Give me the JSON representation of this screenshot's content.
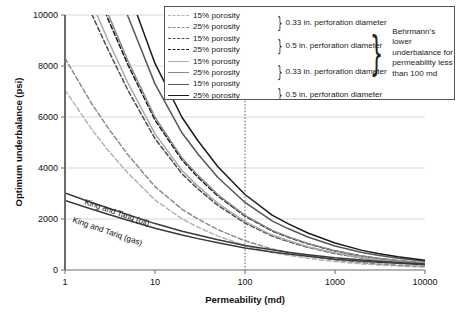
{
  "chart_data": {
    "type": "line",
    "title": "",
    "xlabel": "Permeability (md)",
    "ylabel": "Optimum underbalance (psi)",
    "xscale": "log",
    "xlim": [
      1,
      10000
    ],
    "ylim": [
      0,
      10000
    ],
    "xticks": [
      1,
      10,
      100,
      1000,
      10000
    ],
    "xtick_labels": [
      "1",
      "10",
      "100",
      "1000",
      "10000"
    ],
    "yticks": [
      0,
      2000,
      4000,
      6000,
      8000,
      10000
    ],
    "ytick_labels": [
      "0",
      "2000",
      "4000",
      "6000",
      "8000",
      "10000"
    ],
    "grid": "horizontal",
    "legend_position": "top-right-inside",
    "annotations": [
      {
        "text": "King and Tariq (oil)",
        "x": 3.2,
        "y": 2450,
        "rotation": 20
      },
      {
        "text": "King and Tariq (gas)",
        "x": 3.2,
        "y": 1900,
        "rotation": 20
      },
      {
        "text": "100 md reference line",
        "type": "vline",
        "x": 100,
        "style": "dotted"
      }
    ],
    "series": [
      {
        "name": "15% porosity, 0.33 in. perforation diameter",
        "style": "dashed",
        "color": "#b4b4b4",
        "x": [
          1,
          2,
          3,
          5,
          10,
          20,
          30,
          50,
          100,
          200,
          300,
          500,
          1000,
          2000,
          3000,
          5000,
          10000
        ],
        "y": [
          7050,
          5500,
          4700,
          3800,
          2750,
          2000,
          1680,
          1330,
          960,
          690,
          580,
          460,
          330,
          240,
          200,
          160,
          115
        ]
      },
      {
        "name": "25% porosity, 0.33 in. perforation diameter",
        "style": "dashed",
        "color": "#8c8c8c",
        "x": [
          1,
          2,
          3,
          5,
          10,
          20,
          30,
          50,
          100,
          200,
          300,
          500,
          1000,
          2000,
          3000,
          5000,
          10000
        ],
        "y": [
          8300,
          6500,
          5580,
          4520,
          3270,
          2380,
          2000,
          1580,
          1145,
          825,
          690,
          550,
          395,
          285,
          240,
          190,
          138
        ]
      },
      {
        "name": "15% porosity, 0.5 in. perforation diameter",
        "style": "dashed",
        "color": "#4d4d4d",
        "x": [
          1,
          2,
          3,
          5,
          10,
          20,
          30,
          50,
          100,
          200,
          300,
          500,
          1000,
          2000,
          3000,
          5000,
          10000
        ],
        "y": [
          12600,
          10000,
          8650,
          7050,
          5150,
          3770,
          3180,
          2530,
          1840,
          1330,
          1120,
          890,
          645,
          470,
          395,
          315,
          230
        ]
      },
      {
        "name": "25% porosity, 0.5 in. perforation diameter",
        "style": "dashed",
        "color": "#1a1a1a",
        "x": [
          1,
          2,
          3,
          5,
          10,
          20,
          30,
          50,
          100,
          200,
          300,
          500,
          1000,
          2000,
          3000,
          5000,
          10000
        ],
        "y": [
          14300,
          11400,
          9850,
          8050,
          5880,
          4310,
          3640,
          2900,
          2110,
          1530,
          1290,
          1025,
          745,
          540,
          455,
          365,
          265
        ]
      },
      {
        "name": "15% porosity, 0.33 in. perforation diameter (solid)",
        "style": "solid",
        "color": "#aaaaaa",
        "x": [
          1,
          2,
          3,
          5,
          10,
          20,
          30,
          50,
          100,
          200,
          300,
          500,
          1000,
          2000,
          3000,
          5000,
          10000
        ],
        "y": [
          13200,
          10450,
          9020,
          7340,
          5340,
          3900,
          3290,
          2610,
          1895,
          1370,
          1155,
          915,
          665,
          480,
          405,
          325,
          235
        ]
      },
      {
        "name": "25% porosity, 0.33 in. perforation diameter (solid)",
        "style": "solid",
        "color": "#8a8a8a",
        "x": [
          1,
          2,
          3,
          5,
          10,
          20,
          30,
          50,
          100,
          200,
          300,
          500,
          1000,
          2000,
          3000,
          5000,
          10000
        ],
        "y": [
          14600,
          11600,
          10050,
          8200,
          5990,
          4390,
          3710,
          2950,
          2145,
          1555,
          1310,
          1040,
          755,
          548,
          462,
          370,
          270
        ]
      },
      {
        "name": "15% porosity, 0.5 in. perforation diameter (solid)",
        "style": "solid",
        "color": "#565656",
        "x": [
          1,
          2,
          3,
          5,
          10,
          20,
          30,
          50,
          100,
          200,
          300,
          500,
          1000,
          2000,
          3000,
          5000,
          10000
        ],
        "y": [
          17500,
          14000,
          12150,
          9950,
          7300,
          5370,
          4550,
          3630,
          2650,
          1925,
          1625,
          1295,
          942,
          685,
          578,
          463,
          338
        ]
      },
      {
        "name": "25% porosity, 0.5 in. perforation diameter (solid)",
        "style": "solid",
        "color": "#1a1a1a",
        "x": [
          1,
          2,
          3,
          5,
          10,
          20,
          30,
          50,
          100,
          200,
          300,
          500,
          1000,
          2000,
          3000,
          5000,
          10000
        ],
        "y": [
          19200,
          15400,
          13400,
          11000,
          8100,
          5980,
          5070,
          4050,
          2960,
          2155,
          1820,
          1450,
          1057,
          770,
          650,
          521,
          380
        ]
      },
      {
        "name": "King and Tariq (oil)",
        "style": "solid",
        "color": "#3a3a3a",
        "x": [
          1,
          2,
          3,
          5,
          10,
          20,
          30,
          50,
          100,
          200,
          300,
          500,
          1000,
          2000,
          3000,
          5000,
          10000
        ],
        "y": [
          3020,
          2640,
          2430,
          2170,
          1820,
          1520,
          1370,
          1190,
          960,
          790,
          700,
          600,
          480,
          390,
          345,
          295,
          240
        ]
      },
      {
        "name": "King and Tariq (gas)",
        "style": "solid",
        "color": "#3a3a3a",
        "x": [
          1,
          2,
          3,
          5,
          10,
          20,
          30,
          50,
          100,
          200,
          300,
          500,
          1000,
          2000,
          3000,
          5000,
          10000
        ],
        "y": [
          2730,
          2380,
          2190,
          1950,
          1640,
          1370,
          1230,
          1065,
          860,
          705,
          625,
          535,
          425,
          345,
          305,
          260,
          210
        ]
      }
    ]
  },
  "axes": {
    "ylabel": "Optimum underbalance (psi)",
    "xlabel": "Permeability (md)",
    "yticks": [
      "10000",
      "8000",
      "6000",
      "4000",
      "2000",
      "0"
    ],
    "xticks": [
      "1",
      "10",
      "100",
      "1000",
      "10000"
    ]
  },
  "curve_labels": {
    "oil": "King and Tariq (oil)",
    "gas": "King and Tariq (gas)"
  },
  "legend": {
    "rows": [
      {
        "label": "15% porosity",
        "style": "dashed",
        "color": "#b4b4b4"
      },
      {
        "label": "25% porosity",
        "style": "dashed",
        "color": "#8c8c8c"
      },
      {
        "label": "15% porosity",
        "style": "dashed",
        "color": "#4d4d4d"
      },
      {
        "label": "25% porosity",
        "style": "dashed",
        "color": "#1a1a1a"
      },
      {
        "label": "15% porosity",
        "style": "solid",
        "color": "#aaaaaa"
      },
      {
        "label": "25% porosity",
        "style": "solid",
        "color": "#8a8a8a"
      },
      {
        "label": "15% porosity",
        "style": "solid",
        "color": "#565656"
      },
      {
        "label": "25% porosity",
        "style": "solid",
        "color": "#1a1a1a"
      }
    ],
    "groups": [
      {
        "note": "0.33 in. perforation diameter"
      },
      {
        "note": "0.5 in. perforation diameter"
      },
      {
        "note": "0.33 in. perforation diameter"
      },
      {
        "note": "0.5 in. perforation diameter"
      }
    ],
    "behrmann_note": "Behrmann's lower underbalance for permeability less than 100 md"
  }
}
